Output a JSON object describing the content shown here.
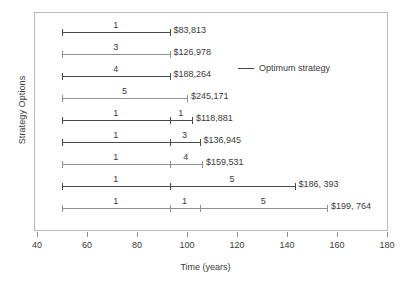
{
  "chart_data": {
    "type": "bar",
    "title": "",
    "xlabel": "Time (years)",
    "ylabel": "Strategy Options",
    "xlim": [
      40,
      180
    ],
    "xticks": [
      40,
      60,
      80,
      100,
      120,
      140,
      160,
      180
    ],
    "xtick_labels": [
      "40",
      "60",
      "80",
      "100",
      "120",
      "140",
      "160",
      "180"
    ],
    "grid": false,
    "legend": {
      "position": "inside-upper-right",
      "entries": [
        {
          "label": "Optimum strategy",
          "color": "#4a4a4a",
          "marker": "line"
        }
      ]
    },
    "categories": [
      "Option 1",
      "Option 2",
      "Option 3",
      "Option 4",
      "Option 5",
      "Option 6",
      "Option 7",
      "Option 8",
      "Option 9"
    ],
    "rows": [
      {
        "index": 1,
        "start": 50,
        "end": 93,
        "value_label": "$83,813",
        "optimum": true,
        "segments": [
          {
            "label": "1",
            "from": 50,
            "to": 93
          }
        ]
      },
      {
        "index": 2,
        "start": 50,
        "end": 93,
        "value_label": "$126,978",
        "optimum": false,
        "segments": [
          {
            "label": "3",
            "from": 50,
            "to": 93
          }
        ]
      },
      {
        "index": 3,
        "start": 50,
        "end": 93,
        "value_label": "$188,264",
        "optimum": true,
        "segments": [
          {
            "label": "4",
            "from": 50,
            "to": 93
          }
        ]
      },
      {
        "index": 4,
        "start": 50,
        "end": 100,
        "value_label": "$245,171",
        "optimum": false,
        "segments": [
          {
            "label": "5",
            "from": 50,
            "to": 100
          }
        ]
      },
      {
        "index": 5,
        "start": 50,
        "end": 102,
        "value_label": "$118,881",
        "optimum": true,
        "segments": [
          {
            "label": "1",
            "from": 50,
            "to": 93
          },
          {
            "label": "1",
            "from": 93,
            "to": 102
          }
        ]
      },
      {
        "index": 6,
        "start": 50,
        "end": 105,
        "value_label": "$136,945",
        "optimum": true,
        "segments": [
          {
            "label": "1",
            "from": 50,
            "to": 93
          },
          {
            "label": "3",
            "from": 93,
            "to": 105
          }
        ]
      },
      {
        "index": 7,
        "start": 50,
        "end": 106,
        "value_label": "$159,531",
        "optimum": false,
        "segments": [
          {
            "label": "1",
            "from": 50,
            "to": 93
          },
          {
            "label": "4",
            "from": 93,
            "to": 106
          }
        ]
      },
      {
        "index": 8,
        "start": 50,
        "end": 143,
        "value_label": "$186, 393",
        "optimum": true,
        "segments": [
          {
            "label": "1",
            "from": 50,
            "to": 93
          },
          {
            "label": "5",
            "from": 93,
            "to": 143
          }
        ]
      },
      {
        "index": 9,
        "start": 50,
        "end": 156,
        "value_label": "$199, 764",
        "optimum": false,
        "segments": [
          {
            "label": "1",
            "from": 50,
            "to": 93
          },
          {
            "label": "1",
            "from": 93,
            "to": 105
          },
          {
            "label": "5",
            "from": 105,
            "to": 156
          }
        ]
      }
    ]
  }
}
